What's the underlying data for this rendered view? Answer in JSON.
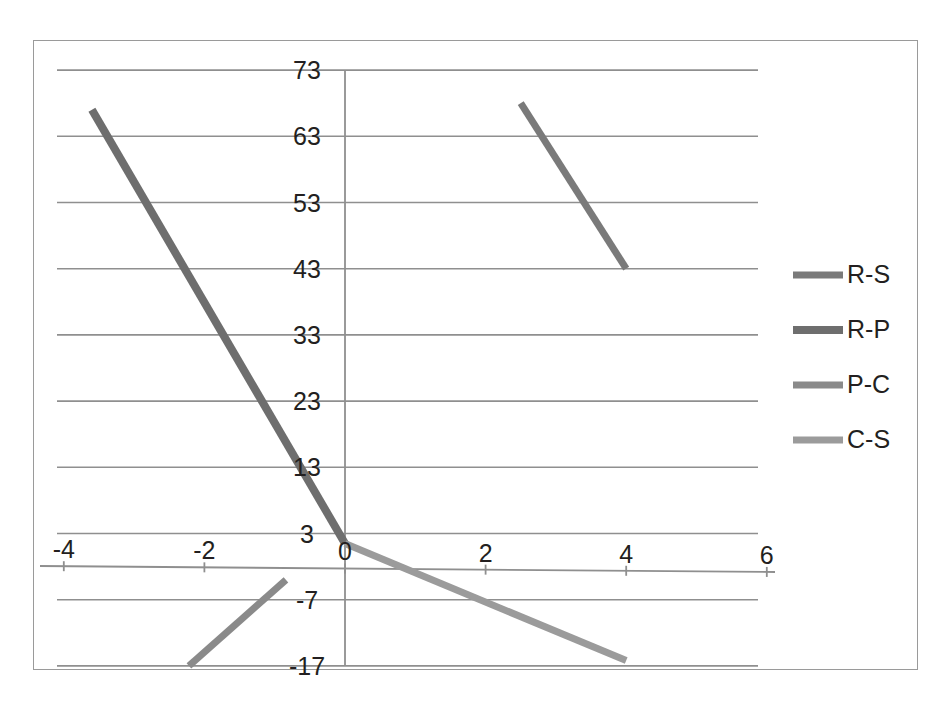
{
  "chart_data": {
    "type": "line",
    "title": "",
    "xlabel": "",
    "ylabel": "",
    "xlim": [
      -4,
      6
    ],
    "ylim": [
      -17,
      73
    ],
    "xticks": [
      -4,
      -2,
      0,
      2,
      4,
      6
    ],
    "yticks": [
      -17,
      -7,
      3,
      13,
      23,
      33,
      43,
      53,
      63,
      73
    ],
    "xtick_labels": [
      "-4",
      "-2",
      "0",
      "2",
      "4",
      "6"
    ],
    "ytick_labels": [
      "-17",
      "-7",
      "3",
      "13",
      "23",
      "33",
      "43",
      "53",
      "63",
      "73"
    ],
    "grid": "horizontal",
    "legend_position": "right",
    "series": [
      {
        "name": "R-S",
        "color": "#7a7a7a",
        "width": 7,
        "points": [
          [
            2.5,
            68
          ],
          [
            4.0,
            43
          ]
        ]
      },
      {
        "name": "R-P",
        "color": "#6e6e6e",
        "width": 8,
        "points": [
          [
            -3.6,
            67
          ],
          [
            0.0,
            1.5
          ]
        ]
      },
      {
        "name": "P-C",
        "color": "#8a8a8a",
        "width": 7,
        "points": [
          [
            -2.22,
            -17
          ],
          [
            -0.84,
            -4.0
          ]
        ]
      },
      {
        "name": "C-S",
        "color": "#9b9b9b",
        "width": 7,
        "points": [
          [
            0.0,
            1.5
          ],
          [
            4.0,
            -16.2
          ]
        ]
      }
    ]
  },
  "legend": {
    "items": [
      {
        "label": "R-S",
        "color": "#7a7a7a"
      },
      {
        "label": "R-P",
        "color": "#6e6e6e"
      },
      {
        "label": "P-C",
        "color": "#8a8a8a"
      },
      {
        "label": "C-S",
        "color": "#9b9b9b"
      }
    ]
  },
  "axes": {
    "x_axis_name": "horizontal-axis",
    "y_axis_name": "vertical-axis"
  }
}
